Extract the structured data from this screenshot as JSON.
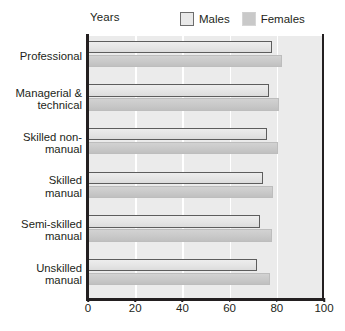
{
  "chart_data": {
    "type": "bar",
    "orientation": "horizontal",
    "title": "",
    "subtitle": "",
    "xlabel": "Years",
    "ylabel": "",
    "xlim": [
      0,
      100
    ],
    "xticks": [
      0,
      20,
      40,
      60,
      80,
      100
    ],
    "grid": "vertical-white-gridlines",
    "legend_position": "top-right",
    "categories": [
      "Professional",
      "Managerial & technical",
      "Skilled non-manual",
      "Skilled manual",
      "Semi-skilled manual",
      "Unskilled manual"
    ],
    "series": [
      {
        "name": "Males",
        "color": "#e6e6e6",
        "values": [
          78,
          76.5,
          76,
          74,
          73,
          71.5
        ]
      },
      {
        "name": "Females",
        "color": "#c8c8c8",
        "values": [
          82,
          81,
          80.5,
          78.5,
          78,
          77
        ]
      }
    ]
  },
  "axis": {
    "years_label": "Years",
    "tick_labels": [
      "0",
      "20",
      "40",
      "60",
      "80",
      "100"
    ],
    "category_labels": [
      [
        "Professional"
      ],
      [
        "Managerial &",
        "technical"
      ],
      [
        "Skilled non-",
        "manual"
      ],
      [
        "Skilled",
        "manual"
      ],
      [
        "Semi-skilled",
        "manual"
      ],
      [
        "Unskilled",
        "manual"
      ]
    ]
  },
  "legend": {
    "items": [
      {
        "label": "Males",
        "swatch": "males-swatch"
      },
      {
        "label": "Females",
        "swatch": "females-swatch"
      }
    ]
  },
  "colors": {
    "plot_background": "#ebebeb",
    "gridline": "#ffffff",
    "axis": "#231f20",
    "males_fill": "#e6e6e6",
    "males_border": "#5d5d5d",
    "females_fill": "#c8c8c8",
    "text": "#231f20"
  }
}
